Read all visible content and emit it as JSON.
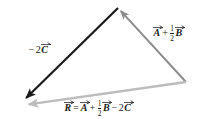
{
  "figure": {
    "background_color": "#ffffff",
    "width": 202,
    "height": 119
  },
  "colors": {
    "dark_vector": "#1a1a1a",
    "mid_gray_vector": "#8c8c8c",
    "light_gray_vector": "#bcbcbc",
    "label_text": "#1a1a1a"
  },
  "vectors": [
    {
      "id": "vector-ab",
      "name": "A plus one half B",
      "color": "#8c8c8c",
      "from": [
        186,
        82
      ],
      "to": [
        118,
        8
      ],
      "arrowhead": "to",
      "width": 2.0
    },
    {
      "id": "vector-c",
      "name": "negative two C",
      "color": "#1a1a1a",
      "from": [
        118,
        8
      ],
      "to": [
        23,
        101
      ],
      "arrowhead": "to",
      "width": 2.2
    },
    {
      "id": "vector-r",
      "name": "resultant R",
      "color": "#bcbcbc",
      "from": [
        186,
        82
      ],
      "to": [
        24,
        105
      ],
      "arrowhead": "to",
      "width": 2.4
    }
  ],
  "labels": {
    "vector_ab": {
      "id": "label-vector-ab",
      "text": "A + 1/2 B",
      "parts": {
        "a": "A",
        "plus": "+",
        "frac_num": "1",
        "frac_den": "2",
        "b": "B"
      }
    },
    "vector_c": {
      "id": "label-vector-c",
      "text": "-2C",
      "parts": {
        "minus": "−",
        "two": "2",
        "c": "C"
      }
    },
    "vector_r": {
      "id": "label-vector-r",
      "text": "R = A + 1/2 B - 2C",
      "parts": {
        "r": "R",
        "equals": "=",
        "a": "A",
        "plus": "+",
        "frac_num": "1",
        "frac_den": "2",
        "b": "B",
        "minus": "−",
        "two": "2",
        "c": "C"
      }
    }
  }
}
